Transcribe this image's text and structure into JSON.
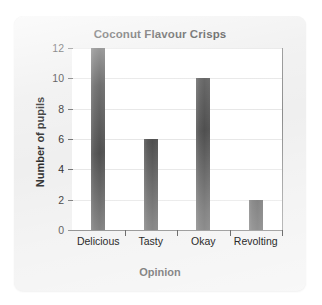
{
  "chart_data": {
    "type": "bar",
    "title": "Coconut Flavour Crisps",
    "xlabel": "Opinion",
    "ylabel": "Number of pupils",
    "categories": [
      "Delicious",
      "Tasty",
      "Okay",
      "Revolting"
    ],
    "values": [
      12,
      6,
      10,
      2
    ],
    "ylim": [
      0,
      12
    ],
    "ytick_labels": [
      "0",
      "2",
      "4",
      "6",
      "8",
      "10",
      "12"
    ],
    "ytick_values": [
      0,
      2,
      4,
      6,
      8,
      10,
      12
    ],
    "grid": "horizontal",
    "legend": "none",
    "bar_color": "#565656",
    "plot_background": "#ffffff",
    "card_background": "#efefef",
    "text_color": "#2b2b2b"
  }
}
